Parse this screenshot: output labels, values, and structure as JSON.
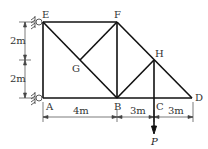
{
  "diagram": {
    "type": "truss",
    "joints": [
      {
        "id": "E",
        "x": 43,
        "y": 22,
        "label": "E"
      },
      {
        "id": "F",
        "x": 117,
        "y": 22,
        "label": "F"
      },
      {
        "id": "G",
        "x": 80,
        "y": 60,
        "label": "G"
      },
      {
        "id": "H",
        "x": 154,
        "y": 60,
        "label": "H"
      },
      {
        "id": "A",
        "x": 43,
        "y": 98,
        "label": "A"
      },
      {
        "id": "B",
        "x": 117,
        "y": 98,
        "label": "B"
      },
      {
        "id": "C",
        "x": 154,
        "y": 98,
        "label": "C"
      },
      {
        "id": "D",
        "x": 192,
        "y": 98,
        "label": "D"
      }
    ],
    "members": [
      [
        "E",
        "F"
      ],
      [
        "E",
        "A"
      ],
      [
        "A",
        "B"
      ],
      [
        "B",
        "C"
      ],
      [
        "C",
        "D"
      ],
      [
        "E",
        "B"
      ],
      [
        "F",
        "G"
      ],
      [
        "F",
        "B"
      ],
      [
        "F",
        "D"
      ],
      [
        "H",
        "B"
      ],
      [
        "H",
        "C"
      ]
    ],
    "supports": [
      "E",
      "A"
    ],
    "dimensions": {
      "vertical": [
        "2m",
        "2m"
      ],
      "horizontal": [
        "4m",
        "3m",
        "3m"
      ]
    },
    "load": {
      "joint": "C",
      "label": "P",
      "direction": "down"
    }
  }
}
